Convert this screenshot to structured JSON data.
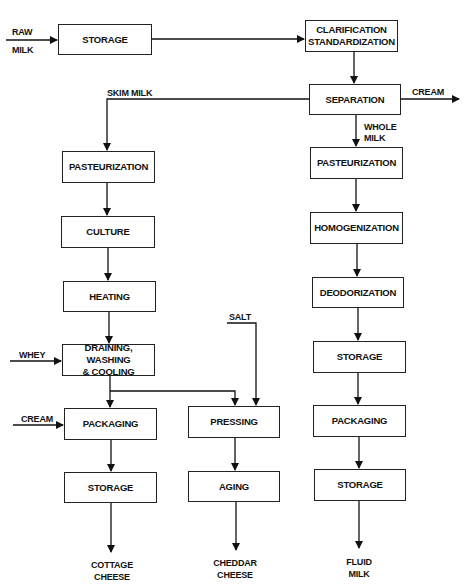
{
  "diagram": {
    "type": "process-flow",
    "inputs": {
      "raw_milk": [
        "RAW",
        "MILK"
      ],
      "skim_milk": "SKIM MILK",
      "cream_out": "CREAM",
      "whole_milk": [
        "WHOLE",
        "MILK"
      ],
      "salt": "SALT",
      "whey": "WHEY",
      "cream_in": "CREAM"
    },
    "nodes": {
      "storage_top": "STORAGE",
      "clarification": [
        "CLARIFICATION",
        "STANDARDIZATION"
      ],
      "separation": "SEPARATION",
      "cottage": {
        "pasteurization": "PASTEURIZATION",
        "culture": "CULTURE",
        "heating": "HEATING",
        "draining": [
          "DRAINING, WASHING",
          "& COOLING"
        ],
        "packaging": "PACKAGING",
        "storage": "STORAGE"
      },
      "cheddar": {
        "pressing": "PRESSING",
        "aging": "AGING"
      },
      "fluid": {
        "pasteurization": "PASTEURIZATION",
        "homogenization": "HOMOGENIZATION",
        "deodorization": "DEODORIZATION",
        "storage1": "STORAGE",
        "packaging": "PACKAGING",
        "storage2": "STORAGE"
      }
    },
    "outputs": {
      "cottage_cheese": [
        "COTTAGE",
        "CHEESE"
      ],
      "cheddar_cheese": [
        "CHEDDAR",
        "CHEESE"
      ],
      "fluid_milk": [
        "FLUID",
        "MILK"
      ]
    }
  }
}
